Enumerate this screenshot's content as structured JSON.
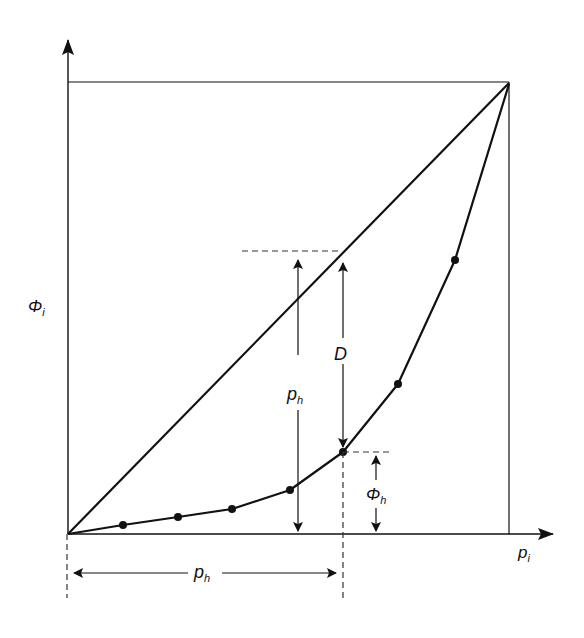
{
  "diagram": {
    "type": "lorenz-curve-hoover-index",
    "colors": {
      "stroke": "#111111",
      "background": "#ffffff",
      "dash": "#333333"
    },
    "axes": {
      "x_label": {
        "main": "p",
        "sub": "i"
      },
      "y_label": {
        "main": "Φ",
        "sub": "i"
      }
    },
    "labels": {
      "vertical_ph": {
        "main": "p",
        "sub": "h"
      },
      "horizontal_ph": {
        "main": "p",
        "sub": "h"
      },
      "D": "D",
      "phi_h": {
        "main": "Φ",
        "sub": "h"
      }
    },
    "curve_points": [
      [
        68,
        534
      ],
      [
        123,
        525
      ],
      [
        178,
        517
      ],
      [
        232,
        509
      ],
      [
        290,
        490
      ],
      [
        343,
        452
      ],
      [
        398,
        384
      ],
      [
        455,
        260
      ],
      [
        509,
        84
      ]
    ],
    "marked_points": [
      [
        123,
        525
      ],
      [
        178,
        517
      ],
      [
        232,
        509
      ],
      [
        290,
        490
      ],
      [
        343,
        452
      ],
      [
        398,
        384
      ],
      [
        455,
        260
      ]
    ]
  }
}
